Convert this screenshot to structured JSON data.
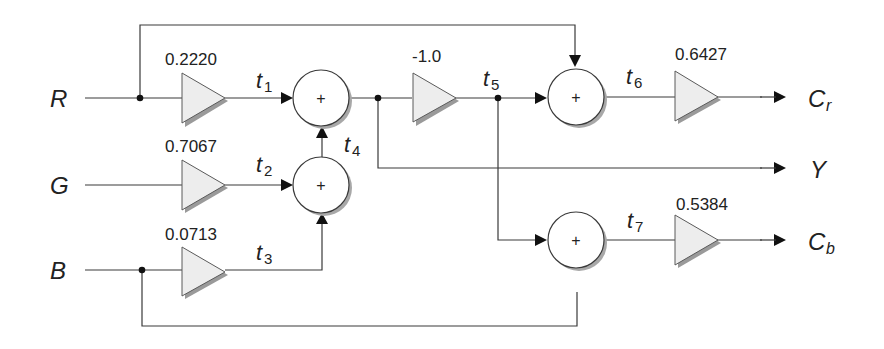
{
  "diagram": {
    "type": "signal-flow block diagram",
    "inputs": [
      {
        "id": "R",
        "label": "R"
      },
      {
        "id": "G",
        "label": "G"
      },
      {
        "id": "B",
        "label": "B"
      }
    ],
    "outputs": [
      {
        "id": "Cr",
        "label": "C",
        "sub": "r"
      },
      {
        "id": "Y",
        "label": "Y",
        "sub": ""
      },
      {
        "id": "Cb",
        "label": "C",
        "sub": "b"
      }
    ],
    "gains": {
      "r": "0.2220",
      "g": "0.7067",
      "b": "0.0713",
      "neg": "-1.0",
      "cr": "0.6427",
      "cb": "0.5384"
    },
    "signals": {
      "t1": {
        "base": "t",
        "sub": "1"
      },
      "t2": {
        "base": "t",
        "sub": "2"
      },
      "t3": {
        "base": "t",
        "sub": "3"
      },
      "t4": {
        "base": "t",
        "sub": "4"
      },
      "t5": {
        "base": "t",
        "sub": "5"
      },
      "t6": {
        "base": "t",
        "sub": "6"
      },
      "t7": {
        "base": "t",
        "sub": "7"
      }
    },
    "adder_symbol": "+",
    "edges": [
      [
        "R",
        "gain_r"
      ],
      [
        "gain_r",
        "adder1",
        "t1"
      ],
      [
        "G",
        "gain_g"
      ],
      [
        "gain_g",
        "adder2",
        "t2"
      ],
      [
        "B",
        "gain_b"
      ],
      [
        "gain_b",
        "adder2",
        "t3"
      ],
      [
        "adder2",
        "adder1",
        "t4"
      ],
      [
        "adder1",
        "Y"
      ],
      [
        "adder1",
        "gain_neg"
      ],
      [
        "gain_neg",
        "adder_cr",
        "t5"
      ],
      [
        "R",
        "adder_cr"
      ],
      [
        "adder_cr",
        "gain_cr",
        "t6"
      ],
      [
        "gain_cr",
        "Cr"
      ],
      [
        "gain_neg",
        "adder_cb",
        "t5"
      ],
      [
        "B",
        "adder_cb"
      ],
      [
        "adder_cb",
        "gain_cb",
        "t7"
      ],
      [
        "gain_cb",
        "Cb"
      ]
    ]
  }
}
